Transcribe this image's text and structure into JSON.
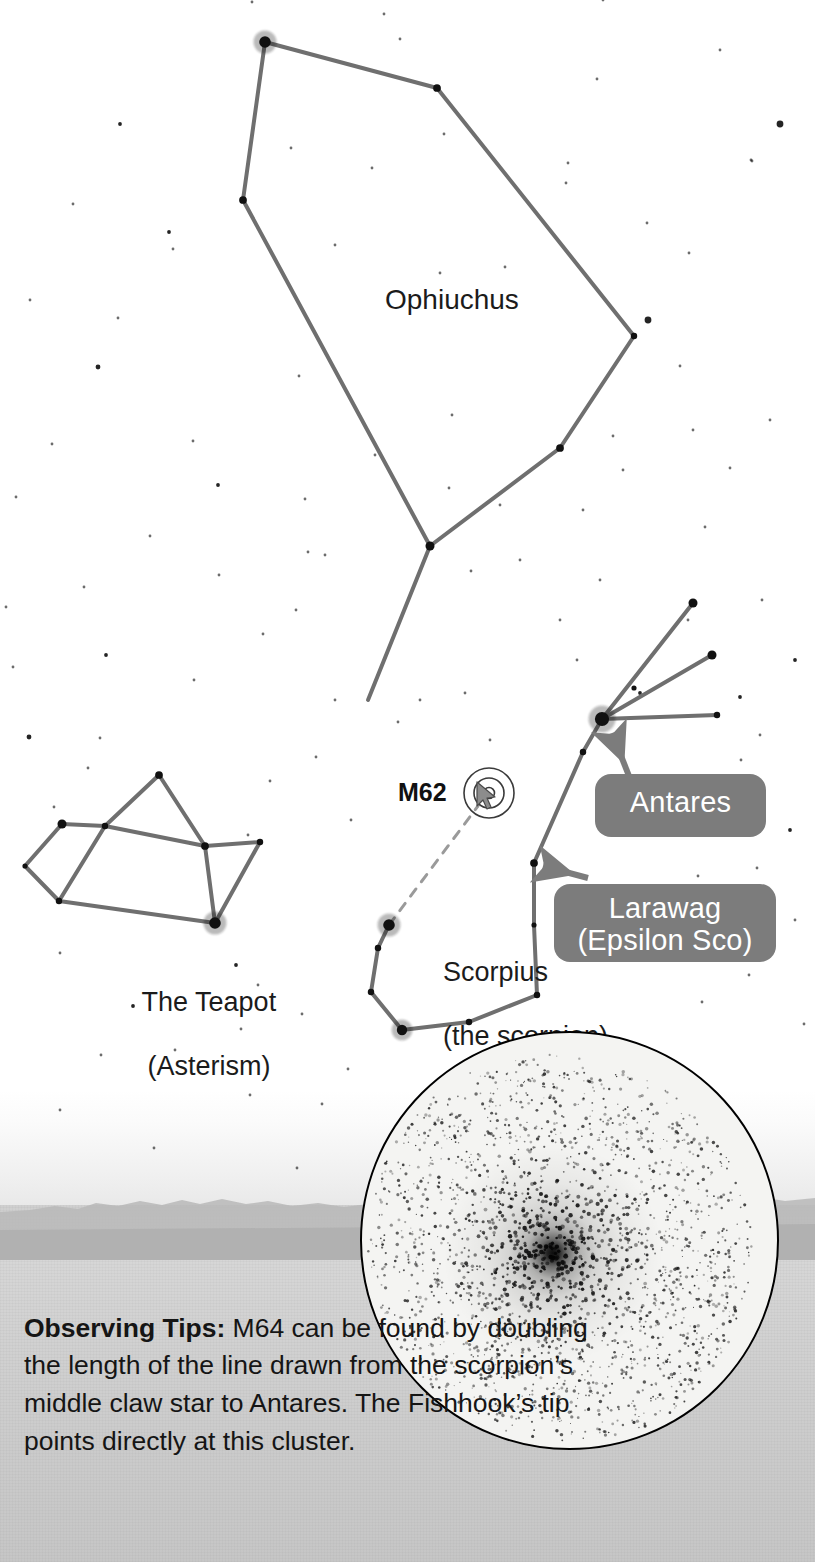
{
  "labels": {
    "ophiuchus": "Ophiuchus",
    "scorpius_line1": "Scorpius",
    "scorpius_line2": "(the scorpion)",
    "teapot_line1": "The Teapot",
    "teapot_line2": "(Asterism)",
    "m62": "M62"
  },
  "callouts": {
    "antares": "Antares",
    "larawag_line1": "Larawag",
    "larawag_line2": "(Epsilon Sco)"
  },
  "observing_tips": {
    "heading": "Observing Tips:",
    "body": " M64 can be found by doubling the length of the line drawn from the scorpion’s middle claw star to Antares. The Fishhook’s tip points directly at this cluster."
  },
  "icons": {
    "globular_cluster_symbol": "globular-cluster-icon",
    "mouse_cursor": "cursor-arrow-icon",
    "antares_arrow": "callout-arrow-icon",
    "larawag_arrow": "callout-arrow-icon"
  },
  "colors": {
    "constellation_line": "#6f6f6f",
    "star": "#111111",
    "callout_background": "#7c7c7c",
    "callout_text": "#ffffff",
    "text": "#151515",
    "inset_border": "#000000",
    "ground": "#cfcfcf"
  },
  "chart_data": {
    "type": "scatter",
    "xlabel": "",
    "ylabel": "",
    "xlim": [
      0,
      815
    ],
    "ylim": [
      0,
      1562
    ],
    "grid": false,
    "legend": "none",
    "constellations": [
      {
        "name": "Ophiuchus",
        "label_position": [
          385,
          283
        ],
        "stars": [
          {
            "id": "oph-head",
            "x": 265,
            "y": 42,
            "mag_radius": 9
          },
          {
            "id": "oph-ne",
            "x": 437,
            "y": 88,
            "mag_radius": 6
          },
          {
            "id": "oph-e",
            "x": 634,
            "y": 336,
            "mag_radius": 5
          },
          {
            "id": "oph-se",
            "x": 560,
            "y": 448,
            "mag_radius": 6
          },
          {
            "id": "oph-s",
            "x": 430,
            "y": 546,
            "mag_radius": 7
          },
          {
            "id": "oph-w",
            "x": 243,
            "y": 200,
            "mag_radius": 6
          },
          {
            "id": "oph-leg-tip",
            "x": 368,
            "y": 700,
            "mag_radius": 0
          }
        ],
        "lines": [
          [
            "oph-head",
            "oph-ne"
          ],
          [
            "oph-ne",
            "oph-e"
          ],
          [
            "oph-e",
            "oph-se"
          ],
          [
            "oph-se",
            "oph-s"
          ],
          [
            "oph-s",
            "oph-w"
          ],
          [
            "oph-w",
            "oph-head"
          ],
          [
            "oph-s",
            "oph-leg-tip"
          ]
        ]
      },
      {
        "name": "Scorpius",
        "label_position": [
          413,
          925
        ],
        "stars": [
          {
            "id": "antares",
            "x": 602,
            "y": 719,
            "mag_radius": 11
          },
          {
            "id": "claw-upper",
            "x": 693,
            "y": 603,
            "mag_radius": 7
          },
          {
            "id": "claw-mid-inner",
            "x": 634,
            "y": 688,
            "mag_radius": 4
          },
          {
            "id": "claw-middle",
            "x": 712,
            "y": 655,
            "mag_radius": 7
          },
          {
            "id": "claw-lower",
            "x": 717,
            "y": 715,
            "mag_radius": 5
          },
          {
            "id": "sco-sigma",
            "x": 583,
            "y": 752,
            "mag_radius": 5
          },
          {
            "id": "larawag",
            "x": 534,
            "y": 863,
            "mag_radius": 6
          },
          {
            "id": "sco-mu",
            "x": 534,
            "y": 925,
            "mag_radius": 4
          },
          {
            "id": "sco-zeta",
            "x": 537,
            "y": 995,
            "mag_radius": 5
          },
          {
            "id": "sco-eta",
            "x": 469,
            "y": 1022,
            "mag_radius": 5
          },
          {
            "id": "sco-theta",
            "x": 402,
            "y": 1030,
            "mag_radius": 8
          },
          {
            "id": "sco-iota",
            "x": 371,
            "y": 992,
            "mag_radius": 5
          },
          {
            "id": "sco-kappa",
            "x": 378,
            "y": 948,
            "mag_radius": 5
          },
          {
            "id": "sco-claw-mid-star",
            "x": 389,
            "y": 925,
            "mag_radius": 9
          }
        ],
        "lines": [
          [
            "antares",
            "claw-upper"
          ],
          [
            "antares",
            "claw-middle"
          ],
          [
            "antares",
            "claw-lower"
          ],
          [
            "antares",
            "sco-sigma"
          ],
          [
            "sco-sigma",
            "larawag"
          ],
          [
            "larawag",
            "sco-mu"
          ],
          [
            "sco-mu",
            "sco-zeta"
          ],
          [
            "sco-zeta",
            "sco-eta"
          ],
          [
            "sco-eta",
            "sco-theta"
          ],
          [
            "sco-theta",
            "sco-iota"
          ],
          [
            "sco-iota",
            "sco-kappa"
          ],
          [
            "sco-kappa",
            "sco-claw-mid-star"
          ]
        ]
      },
      {
        "name": "The Teapot",
        "label_position": [
          112,
          955
        ],
        "stars": [
          {
            "id": "tp-lid",
            "x": 159,
            "y": 775,
            "mag_radius": 6
          },
          {
            "id": "tp-nw",
            "x": 62,
            "y": 824,
            "mag_radius": 7
          },
          {
            "id": "tp-inner-top",
            "x": 105,
            "y": 826,
            "mag_radius": 5
          },
          {
            "id": "tp-w",
            "x": 25,
            "y": 866,
            "mag_radius": 4
          },
          {
            "id": "tp-sw",
            "x": 59,
            "y": 901,
            "mag_radius": 5
          },
          {
            "id": "tp-center",
            "x": 205,
            "y": 846,
            "mag_radius": 6
          },
          {
            "id": "tp-e",
            "x": 260,
            "y": 842,
            "mag_radius": 5
          },
          {
            "id": "tp-s",
            "x": 215,
            "y": 923,
            "mag_radius": 9
          }
        ],
        "lines": [
          [
            "tp-lid",
            "tp-inner-top"
          ],
          [
            "tp-lid",
            "tp-center"
          ],
          [
            "tp-nw",
            "tp-inner-top"
          ],
          [
            "tp-nw",
            "tp-w"
          ],
          [
            "tp-w",
            "tp-sw"
          ],
          [
            "tp-inner-top",
            "tp-center"
          ],
          [
            "tp-inner-top",
            "tp-sw"
          ],
          [
            "tp-sw",
            "tp-s"
          ],
          [
            "tp-center",
            "tp-e"
          ],
          [
            "tp-center",
            "tp-s"
          ],
          [
            "tp-e",
            "tp-s"
          ]
        ]
      }
    ],
    "deep_sky_objects": [
      {
        "id": "m62",
        "label": "M62",
        "symbol": "globular-cluster",
        "x": 489,
        "y": 793,
        "radius": 25
      }
    ],
    "guide_lines": [
      {
        "from": [
          389,
          925
        ],
        "to": [
          478,
          806
        ],
        "style": "dashed",
        "note": "doubling line from middle claw star toward M62"
      }
    ],
    "background_stars": [
      [
        120,
        124,
        3
      ],
      [
        780,
        124,
        6
      ],
      [
        751,
        160,
        2
      ],
      [
        169,
        232,
        3
      ],
      [
        173,
        249,
        2
      ],
      [
        384,
        14,
        2
      ],
      [
        603,
        0,
        2
      ],
      [
        252,
        2,
        2
      ],
      [
        400,
        39,
        2
      ],
      [
        566,
        183,
        2
      ],
      [
        98,
        367,
        4
      ],
      [
        568,
        163,
        2
      ],
      [
        752,
        161,
        2
      ],
      [
        648,
        320,
        6
      ],
      [
        440,
        273,
        2
      ],
      [
        372,
        168,
        2
      ],
      [
        73,
        204,
        2
      ],
      [
        218,
        485,
        3
      ],
      [
        305,
        499,
        2
      ],
      [
        299,
        376,
        2
      ],
      [
        29,
        737,
        4
      ],
      [
        647,
        223,
        2
      ],
      [
        375,
        455,
        2
      ],
      [
        452,
        415,
        2
      ],
      [
        449,
        488,
        2
      ],
      [
        500,
        505,
        2
      ],
      [
        583,
        510,
        2
      ],
      [
        705,
        527,
        2
      ],
      [
        680,
        366,
        2
      ],
      [
        308,
        552,
        2
      ],
      [
        325,
        555,
        2
      ],
      [
        296,
        610,
        2
      ],
      [
        13,
        667,
        2
      ],
      [
        106,
        655,
        3
      ],
      [
        100,
        738,
        2
      ],
      [
        194,
        680,
        2
      ],
      [
        316,
        757,
        2
      ],
      [
        270,
        781,
        2
      ],
      [
        54,
        807,
        2
      ],
      [
        88,
        768,
        2
      ],
      [
        248,
        835,
        2
      ],
      [
        351,
        820,
        2
      ],
      [
        335,
        700,
        2
      ],
      [
        398,
        722,
        2
      ],
      [
        420,
        700,
        2
      ],
      [
        465,
        693,
        2
      ],
      [
        490,
        740,
        2
      ],
      [
        600,
        580,
        2
      ],
      [
        688,
        620,
        2
      ],
      [
        762,
        600,
        2
      ],
      [
        795,
        660,
        3
      ],
      [
        741,
        760,
        2
      ],
      [
        748,
        782,
        3
      ],
      [
        790,
        830,
        3
      ],
      [
        757,
        868,
        2
      ],
      [
        698,
        876,
        2
      ],
      [
        654,
        930,
        2
      ],
      [
        795,
        920,
        2
      ],
      [
        749,
        975,
        2
      ],
      [
        702,
        1002,
        2
      ],
      [
        804,
        1024,
        2
      ],
      [
        60,
        953,
        2
      ],
      [
        236,
        965,
        3
      ],
      [
        258,
        985,
        2
      ],
      [
        302,
        1014,
        2
      ],
      [
        175,
        1050,
        2
      ],
      [
        101,
        1055,
        2
      ],
      [
        250,
        1095,
        2
      ],
      [
        60,
        1110,
        2
      ],
      [
        154,
        1148,
        2
      ],
      [
        297,
        1168,
        2
      ],
      [
        322,
        1104,
        2
      ],
      [
        348,
        1069,
        2
      ],
      [
        241,
        1029,
        2
      ],
      [
        133,
        1006,
        3
      ],
      [
        640,
        693,
        3
      ],
      [
        560,
        620,
        2
      ],
      [
        577,
        660,
        2
      ],
      [
        520,
        560,
        2
      ],
      [
        471,
        571,
        2
      ],
      [
        613,
        436,
        2
      ],
      [
        693,
        430,
        2
      ],
      [
        623,
        470,
        2
      ],
      [
        730,
        468,
        2
      ],
      [
        770,
        420,
        2
      ],
      [
        16,
        497,
        2
      ],
      [
        150,
        536,
        2
      ],
      [
        84,
        587,
        2
      ],
      [
        219,
        575,
        2
      ],
      [
        263,
        634,
        2
      ],
      [
        193,
        441,
        2
      ],
      [
        118,
        318,
        2
      ],
      [
        30,
        300,
        2
      ],
      [
        52,
        444,
        2
      ],
      [
        6,
        607,
        2
      ],
      [
        335,
        245,
        2
      ],
      [
        291,
        148,
        2
      ],
      [
        444,
        134,
        2
      ],
      [
        505,
        267,
        2
      ],
      [
        720,
        50,
        2
      ],
      [
        689,
        253,
        2
      ],
      [
        597,
        79,
        2
      ],
      [
        740,
        697,
        3
      ],
      [
        760,
        735,
        2
      ],
      [
        706,
        824,
        2
      ],
      [
        663,
        779,
        3
      ]
    ]
  }
}
